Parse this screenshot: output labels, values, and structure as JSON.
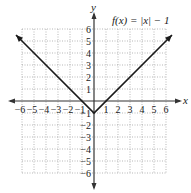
{
  "chart_data": {
    "type": "line",
    "title": "f(x) = |x| − 1",
    "xlabel": "x",
    "ylabel": "y",
    "xlim": [
      -6,
      6
    ],
    "ylim": [
      -6,
      6
    ],
    "grid": true,
    "x_ticks": [
      "−6",
      "−5",
      "−4",
      "−3",
      "−2",
      "−1",
      "1",
      "2",
      "3",
      "4",
      "5",
      "6"
    ],
    "y_ticks": [
      "6",
      "5",
      "4",
      "3",
      "2",
      "1",
      "−1",
      "−2",
      "−3",
      "−4",
      "−5",
      "−6"
    ],
    "series": [
      {
        "name": "f(x) = |x| − 1",
        "x": [
          -6.5,
          0,
          6.5
        ],
        "y": [
          5.5,
          -1,
          5.5
        ]
      }
    ],
    "vertex": [
      0,
      -1
    ],
    "colors": {
      "axis": "#333333",
      "grid": "#9a9a9a",
      "line": "#1a1a1a"
    }
  },
  "labels": {
    "function": "f(x) = |x| − 1",
    "x_axis": "x",
    "y_axis": "y"
  }
}
